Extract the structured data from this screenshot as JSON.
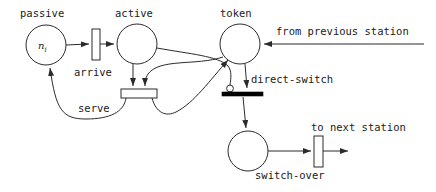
{
  "diagram": {
    "stroke_color": "#2b2b2b",
    "fill_color": "#ffffff",
    "solid_bar_color": "#000000"
  },
  "places": [
    {
      "id": "passive",
      "label": "passive",
      "marking": "n",
      "marking_sub": "i",
      "cx": 46,
      "cy": 45,
      "r": 20
    },
    {
      "id": "active",
      "label": "active",
      "marking": "",
      "marking_sub": "",
      "cx": 137,
      "cy": 44,
      "r": 20
    },
    {
      "id": "token",
      "label": "token",
      "marking": "",
      "marking_sub": "",
      "cx": 240,
      "cy": 44,
      "r": 20
    },
    {
      "id": "waiting",
      "label": "",
      "marking": "",
      "marking_sub": "",
      "cx": 248,
      "cy": 151,
      "r": 20
    }
  ],
  "transitions": [
    {
      "id": "arrive",
      "label": "arrive",
      "style": "open-vertical",
      "x": 92,
      "y": 29,
      "w": 8,
      "h": 31
    },
    {
      "id": "serve",
      "label": "serve",
      "style": "open-horizontal",
      "x": 121,
      "y": 89,
      "w": 36,
      "h": 9
    },
    {
      "id": "direct-switch",
      "label": "direct-switch",
      "style": "solid-horizontal",
      "x": 222,
      "y": 92,
      "w": 41,
      "h": 4
    },
    {
      "id": "switch-over",
      "label": "switch-over",
      "style": "open-vertical",
      "x": 314,
      "y": 136,
      "w": 9,
      "h": 31
    }
  ],
  "external_labels": [
    {
      "id": "from-previous-station",
      "text": "from previous station"
    },
    {
      "id": "to-next-station",
      "text": "to next station"
    }
  ],
  "label_positions": {
    "passive": {
      "x": 20,
      "y": 8
    },
    "active": {
      "x": 115,
      "y": 8
    },
    "token": {
      "x": 220,
      "y": 8
    },
    "arrive": {
      "x": 74,
      "y": 67
    },
    "serve": {
      "x": 78,
      "y": 103
    },
    "direct_switch": {
      "x": 251,
      "y": 74
    },
    "switch_over": {
      "x": 255,
      "y": 170
    },
    "from_previous_station": {
      "x": 276,
      "y": 26
    },
    "to_next_station": {
      "x": 311,
      "y": 122
    },
    "token_ni": {
      "x": 38,
      "y": 41
    }
  },
  "arcs": [
    {
      "id": "passive-to-arrive",
      "from": "passive",
      "to": "arrive",
      "kind": "normal"
    },
    {
      "id": "arrive-to-active",
      "from": "arrive",
      "to": "active",
      "kind": "normal"
    },
    {
      "id": "active-to-serve",
      "from": "active",
      "to": "serve",
      "kind": "normal"
    },
    {
      "id": "token-to-serve",
      "from": "token",
      "to": "serve",
      "kind": "normal"
    },
    {
      "id": "serve-to-passive",
      "from": "serve",
      "to": "passive",
      "kind": "normal"
    },
    {
      "id": "serve-to-token",
      "from": "serve",
      "to": "token",
      "kind": "normal"
    },
    {
      "id": "previous-station-to-token",
      "from": "from previous station",
      "to": "token",
      "kind": "normal"
    },
    {
      "id": "token-to-direct-switch",
      "from": "token",
      "to": "direct-switch",
      "kind": "normal"
    },
    {
      "id": "active-to-direct-switch-inhibitor",
      "from": "active",
      "to": "direct-switch",
      "kind": "inhibitor"
    },
    {
      "id": "direct-switch-to-waiting",
      "from": "direct-switch",
      "to": "waiting",
      "kind": "normal"
    },
    {
      "id": "waiting-to-switch-over",
      "from": "waiting",
      "to": "switch-over",
      "kind": "normal"
    },
    {
      "id": "switch-over-to-next-station",
      "from": "switch-over",
      "to": "to next station",
      "kind": "normal"
    }
  ]
}
